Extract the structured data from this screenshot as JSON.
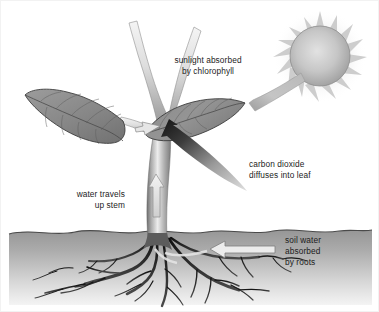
{
  "figure": {
    "background_color": "#ffffff",
    "border_color": "#f2f2f2"
  },
  "palette": {
    "text": "#1c1c1c",
    "leaf_fill": "#8d8d8d",
    "leaf_fill_dark": "#7a7a7a",
    "leaf_outline": "#3a3a3a",
    "stem_light": "#e9e9e9",
    "stem_mid": "#a8a8a8",
    "stem_dark": "#6e6e6e",
    "soil_top": "#9a9a9a",
    "soil_bottom": "#efefef",
    "root_color": "#1a1a1a",
    "sun_core": "#d9d9d9",
    "sun_edge": "#9b9b9b",
    "sun_ray": "#d0d0d0",
    "beam_color": "#b4b4b4",
    "co2_arrow_dark": "#1a1a1a",
    "co2_arrow_light": "#d5d5d5",
    "white_arrow_fill": "#ededed",
    "white_arrow_stroke": "#8a8a8a"
  },
  "labels": {
    "sunlight": {
      "id": "sunlight-absorbed-label",
      "lines": [
        "sunlight absorbed",
        "by chlorophyll"
      ],
      "align": "middle",
      "x": 207,
      "y": 62
    },
    "carbon_dioxide": {
      "id": "carbon-dioxide-label",
      "lines": [
        "carbon dioxide",
        "diffuses into leaf"
      ],
      "align": "start",
      "x": 248,
      "y": 166
    },
    "water": {
      "id": "water-travels-label",
      "lines": [
        "water travels",
        "up stem"
      ],
      "align": "end",
      "x": 124,
      "y": 196
    },
    "soil_water": {
      "id": "soil-water-label",
      "lines": [
        "soil water",
        "absorbed",
        "by roots"
      ],
      "align": "start",
      "x": 284,
      "y": 242
    }
  },
  "elements": {
    "sun": {
      "name": "sun",
      "cx": 319,
      "cy": 55,
      "r": 30,
      "ray_count": 16
    },
    "sunbeam": {
      "name": "sunbeam",
      "from": "sun",
      "to": "right-leaf-tip"
    },
    "left_leaf": {
      "name": "left-leaf"
    },
    "right_leaf": {
      "name": "right-leaf"
    },
    "stem": {
      "name": "plant-stem"
    },
    "roots": {
      "name": "root-system"
    },
    "soil": {
      "name": "soil-layer",
      "surface_y": 231
    },
    "water_arrow": {
      "name": "water-up-arrow",
      "direction": "up"
    },
    "soil_water_arrow": {
      "name": "soil-water-arrow",
      "direction": "left"
    },
    "leaf_water_arrow": {
      "name": "leaf-water-arrow",
      "direction": "right"
    },
    "co2_arrow": {
      "name": "carbon-dioxide-arrow",
      "direction": "up-left"
    }
  }
}
